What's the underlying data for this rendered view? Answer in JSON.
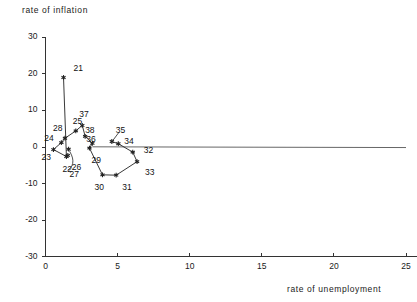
{
  "chart_data": {
    "type": "scatter",
    "title": "",
    "xlabel": "rate of unemployment",
    "ylabel": "rate of inflation",
    "xlim": [
      0,
      26
    ],
    "ylim": [
      -30,
      30
    ],
    "xticks": [
      "0",
      "5",
      "10",
      "15",
      "20",
      "25"
    ],
    "xtick_values": [
      0,
      5,
      10,
      15,
      20,
      25
    ],
    "yticks": [
      "30",
      "20",
      "10",
      "0",
      "-10",
      "-20",
      "-30"
    ],
    "ytick_values": [
      30,
      20,
      10,
      0,
      -10,
      -20,
      -30
    ],
    "grid": false,
    "legend": "none",
    "connected": true,
    "marker": "star",
    "line_color": "#222222",
    "axis_color": "#333333",
    "points": [
      {
        "label": "21",
        "x": 1.25,
        "y": 19.0,
        "lx": 10,
        "ly": -9
      },
      {
        "label": "22",
        "x": 1.45,
        "y": -2.6,
        "lx": -4,
        "ly": 12
      },
      {
        "label": "23",
        "x": 0.55,
        "y": -0.7,
        "lx": -12,
        "ly": 7
      },
      {
        "label": "24",
        "x": 1.1,
        "y": 1.2,
        "lx": -17,
        "ly": -5
      },
      {
        "label": "25",
        "x": 2.1,
        "y": 4.4,
        "lx": -3,
        "ly": -10
      },
      {
        "label": "26",
        "x": 1.55,
        "y": -2.3,
        "lx": 4,
        "ly": 12
      },
      {
        "label": "27",
        "x": 1.6,
        "y": -0.6,
        "lx": 1,
        "ly": 25
      },
      {
        "label": "28",
        "x": 1.35,
        "y": 2.4,
        "lx": -12,
        "ly": -10
      },
      {
        "label": "29",
        "x": 3.05,
        "y": -0.3,
        "lx": 2,
        "ly": 12
      },
      {
        "label": "30",
        "x": 3.95,
        "y": -7.6,
        "lx": -8,
        "ly": 12
      },
      {
        "label": "31",
        "x": 4.9,
        "y": -7.7,
        "lx": 6,
        "ly": 12
      },
      {
        "label": "32",
        "x": 6.05,
        "y": -1.4,
        "lx": 11,
        "ly": -2
      },
      {
        "label": "33",
        "x": 6.35,
        "y": -4.0,
        "lx": 8,
        "ly": 10
      },
      {
        "label": "34",
        "x": 5.05,
        "y": 0.9,
        "lx": 6,
        "ly": -3
      },
      {
        "label": "35",
        "x": 4.6,
        "y": 1.5,
        "lx": 4,
        "ly": -12
      },
      {
        "label": "36",
        "x": 3.25,
        "y": 1.0,
        "lx": -6,
        "ly": -4
      },
      {
        "label": "37",
        "x": 2.55,
        "y": 5.9,
        "lx": -3,
        "ly": -11
      },
      {
        "label": "38",
        "x": 2.75,
        "y": 2.9,
        "lx": 0,
        "ly": -6
      }
    ],
    "path_order": [
      "21",
      "22",
      "23",
      "24",
      "28",
      "25",
      "37",
      "38",
      "36",
      "29",
      "30",
      "31",
      "33",
      "32",
      "34",
      "35"
    ],
    "extra_line": {
      "from": [
        3.25,
        0.05
      ],
      "to": [
        25.0,
        -0.15
      ]
    }
  }
}
